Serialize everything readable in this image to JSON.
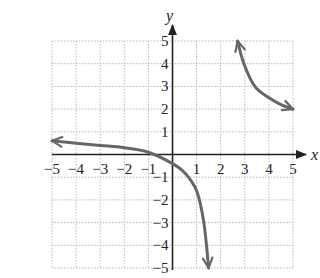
{
  "chart_data": {
    "type": "line",
    "title": "",
    "xlabel": "x",
    "ylabel": "y",
    "xlim": [
      -5,
      5
    ],
    "ylim": [
      -5,
      5
    ],
    "grid": true,
    "legend": null,
    "x_ticks": [
      "−5",
      "−4",
      "−3",
      "−2",
      "−1",
      "1",
      "2",
      "3",
      "4",
      "5"
    ],
    "y_ticks": [
      "5",
      "4",
      "3",
      "2",
      "1",
      "−1",
      "−2",
      "−3",
      "−4",
      "−5"
    ],
    "colors": {
      "curve": "#666666",
      "axis": "#222222",
      "grid": "#b8b8b8",
      "text": "#222222"
    },
    "series": [
      {
        "name": "left-branch",
        "x": [
          -5,
          -4,
          -3,
          -2,
          -1,
          0,
          0.5,
          1,
          1.3,
          1.5
        ],
        "y": [
          0.6,
          0.5,
          0.4,
          0.3,
          0.1,
          -0.4,
          -0.8,
          -1.6,
          -3,
          -5
        ],
        "arrows": [
          "start",
          "end"
        ]
      },
      {
        "name": "right-branch",
        "x": [
          2.7,
          2.9,
          3.2,
          3.5,
          4,
          4.5,
          5
        ],
        "y": [
          5,
          4.2,
          3.4,
          2.9,
          2.5,
          2.2,
          2
        ],
        "arrows": [
          "start",
          "end"
        ]
      }
    ]
  }
}
